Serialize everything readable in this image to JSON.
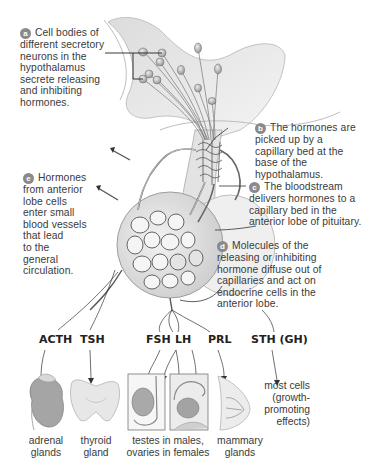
{
  "callouts": [
    {
      "letter": "a",
      "lines": [
        "Cell bodies of",
        "different secretory",
        "neurons in the",
        "hypothalamus",
        "secrete releasing",
        "and inhibiting",
        "hormones."
      ]
    },
    {
      "letter": "b",
      "lines": [
        "The hormones are",
        "picked up by a",
        "capillary bed at the",
        "base of the hypothalamus."
      ]
    },
    {
      "letter": "c",
      "lines": [
        "The bloodstream",
        "delivers hormones to a",
        "capillary bed in the",
        "anterior lobe of pituitary."
      ]
    },
    {
      "letter": "d",
      "lines": [
        "Molecules of the",
        "releasing or inhibiting",
        "hormone diffuse out of",
        "capillaries and act on",
        "endocrine cells in the",
        "anterior lobe."
      ]
    },
    {
      "letter": "e",
      "lines": [
        "Hormones",
        "from anterior",
        "lobe cells",
        "enter small",
        "blood vessels",
        "that lead",
        "to the",
        "general",
        "circulation."
      ]
    }
  ],
  "hormones": [
    "ACTH",
    "TSH",
    "FSH",
    "LH",
    "PRL",
    "STH (GH)"
  ],
  "targets": [
    {
      "lines": [
        "adrenal",
        "glands"
      ]
    },
    {
      "lines": [
        "thyroid",
        "gland"
      ]
    },
    {
      "lines": [
        "testes in males,",
        "ovaries in females"
      ]
    },
    {
      "lines": [
        "mammary",
        "glands"
      ]
    },
    {
      "lines": [
        "most cells",
        "(growth-",
        "promoting",
        "effects)"
      ]
    }
  ],
  "colors": {
    "badge": "#8a8a8a",
    "tissue": "#e6e6e6",
    "line": "#444444",
    "text": "#3a3a3a"
  }
}
